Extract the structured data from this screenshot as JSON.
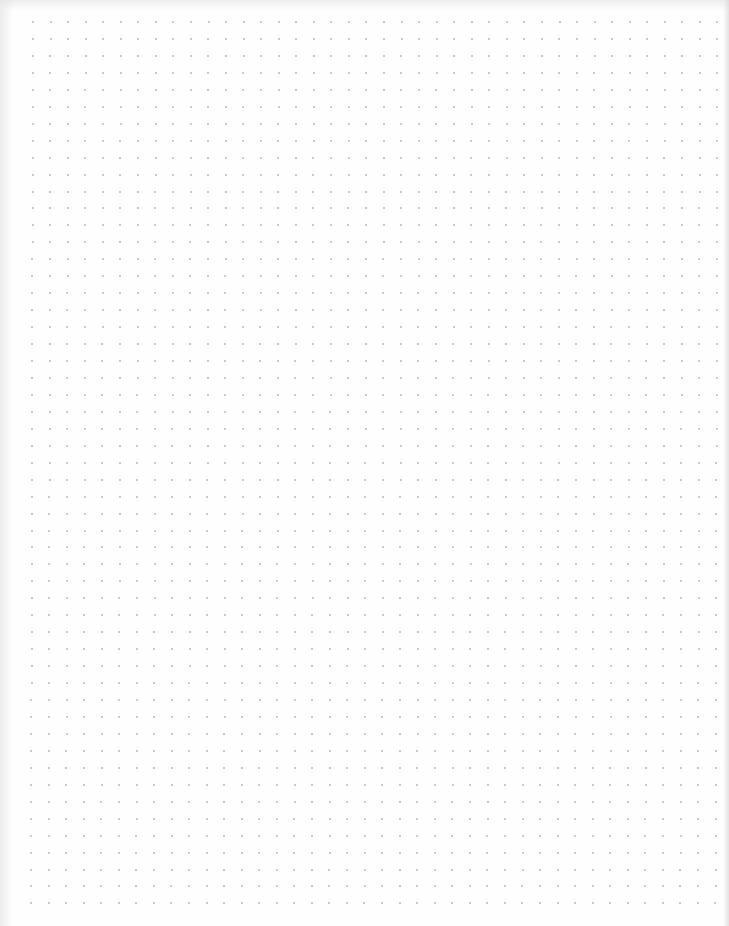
{
  "page": {
    "type": "dot-grid-paper",
    "background_color": "#fefefe",
    "dot_color": "#b8b8b8"
  },
  "grid": {
    "columns": 40,
    "rows": 53,
    "origin_x": 33,
    "origin_y": 22,
    "spacing_x": 17.55,
    "spacing_y": 16.95,
    "dot_size": 2
  }
}
